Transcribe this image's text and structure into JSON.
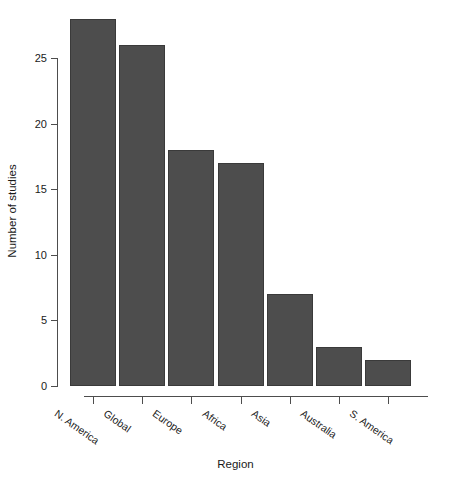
{
  "chart_data": {
    "type": "bar",
    "title": "",
    "xlabel": "Region",
    "ylabel": "Number of studies",
    "categories": [
      "N. America",
      "Global",
      "Europe",
      "Africa",
      "Asia",
      "Australia",
      "S. America"
    ],
    "values": [
      28,
      26,
      18,
      17,
      7,
      3,
      2
    ],
    "ylim": [
      0,
      28
    ],
    "yticks": [
      0,
      5,
      10,
      15,
      20,
      25
    ],
    "ytick_labels": [
      "0",
      "5",
      "10",
      "15",
      "20",
      "25"
    ],
    "grid": false,
    "legend": false,
    "bar_color": "#4d4d4d",
    "bar_border_color": "#3a3a3a",
    "axis_color": "#4d4d4d",
    "background": "#ffffff",
    "xtick_label_rotation": 35
  }
}
